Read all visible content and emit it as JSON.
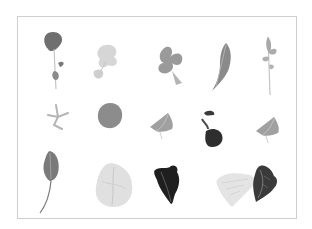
{
  "image": {
    "description": "Grid of fifteen salad leaves and greens photographed on white background",
    "layout": {
      "rows": 3,
      "columns": 5
    },
    "colors": {
      "background": "#ffffff",
      "border": "#cfcfcf"
    },
    "leaves": [
      {
        "row": 1,
        "col": 1,
        "kind": "pea-shoot-sprig",
        "tone": "#6f6f6f"
      },
      {
        "row": 1,
        "col": 2,
        "kind": "pale-frisee-sprig",
        "tone": "#c8c8c8"
      },
      {
        "row": 1,
        "col": 3,
        "kind": "lobed-oak-leaf",
        "tone": "#9a9a9a"
      },
      {
        "row": 1,
        "col": 4,
        "kind": "dandelion-leaf",
        "tone": "#8a8a8a"
      },
      {
        "row": 1,
        "col": 5,
        "kind": "arugula-leaf",
        "tone": "#a8a8a8"
      },
      {
        "row": 2,
        "col": 1,
        "kind": "small-herb-sprig",
        "tone": "#b5b5b5"
      },
      {
        "row": 2,
        "col": 2,
        "kind": "round-leaf",
        "tone": "#8c8c8c"
      },
      {
        "row": 2,
        "col": 3,
        "kind": "triangular-lettuce-tip",
        "tone": "#a0a0a0"
      },
      {
        "row": 2,
        "col": 4,
        "kind": "dark-red-leaf-with-sprig",
        "tone": "#2e2e2e"
      },
      {
        "row": 2,
        "col": 5,
        "kind": "triangular-lettuce-tip",
        "tone": "#a0a0a0"
      },
      {
        "row": 3,
        "col": 1,
        "kind": "spinach-leaf-long-stem",
        "tone": "#7a7a7a"
      },
      {
        "row": 3,
        "col": 2,
        "kind": "pale-butterhead-leaf",
        "tone": "#c4c4c4"
      },
      {
        "row": 3,
        "col": 3,
        "kind": "dark-romaine-leaf",
        "tone": "#1f1f1f"
      },
      {
        "row": 3,
        "col": 4,
        "kind": "pale-frisee-clump",
        "tone": "#d2d2d2"
      },
      {
        "row": 3,
        "col": 5,
        "kind": "dark-curly-leaf",
        "tone": "#3a3a3a"
      }
    ]
  }
}
